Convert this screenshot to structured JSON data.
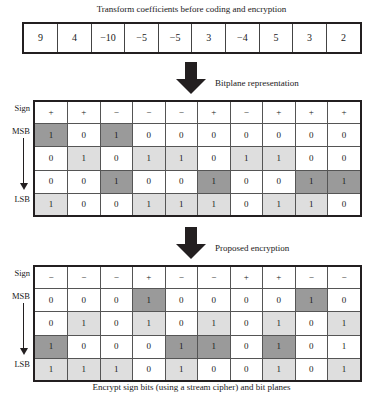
{
  "figure": {
    "top_caption": "Transform coefficients before coding and encryption",
    "bottom_caption": "Encrypt sign bits (using a stream cipher) and bit planes",
    "stage_bitplane_label": "Bitplane representation",
    "stage_encrypt_label": "Proposed encryption",
    "sign_label": "Sign",
    "msb_label": "MSB",
    "lsb_label": "LSB"
  },
  "colors": {
    "ink": "#231f20",
    "shade_light": "#dedede",
    "shade_dark": "#9a9a9a",
    "cell_background": "#ffffff"
  },
  "coefficients": {
    "values": [
      "9",
      "4",
      "−10",
      "−5",
      "−5",
      "3",
      "−4",
      "5",
      "3",
      "2"
    ]
  },
  "bitplane_table": {
    "sign_row": {
      "values": [
        "+",
        "+",
        "−",
        "−",
        "−",
        "+",
        "−",
        "+",
        "+",
        "+"
      ],
      "shades": [
        "none",
        "none",
        "none",
        "none",
        "none",
        "none",
        "none",
        "none",
        "none",
        "none"
      ]
    },
    "rows": [
      {
        "label": "MSB",
        "values": [
          "1",
          "0",
          "1",
          "0",
          "0",
          "0",
          "0",
          "0",
          "0",
          "0"
        ],
        "shades": [
          "dark",
          "none",
          "dark",
          "none",
          "none",
          "none",
          "none",
          "none",
          "none",
          "none"
        ]
      },
      {
        "label": "",
        "values": [
          "0",
          "1",
          "0",
          "1",
          "1",
          "0",
          "1",
          "1",
          "0",
          "0"
        ],
        "shades": [
          "none",
          "light",
          "none",
          "light",
          "light",
          "none",
          "light",
          "light",
          "none",
          "none"
        ]
      },
      {
        "label": "",
        "values": [
          "0",
          "0",
          "1",
          "0",
          "0",
          "1",
          "0",
          "0",
          "1",
          "1"
        ],
        "shades": [
          "none",
          "none",
          "dark",
          "none",
          "none",
          "dark",
          "none",
          "none",
          "dark",
          "dark"
        ]
      },
      {
        "label": "LSB",
        "values": [
          "1",
          "0",
          "0",
          "1",
          "1",
          "1",
          "0",
          "1",
          "1",
          "0"
        ],
        "shades": [
          "light",
          "none",
          "none",
          "light",
          "light",
          "light",
          "none",
          "light",
          "light",
          "none"
        ]
      }
    ]
  },
  "encrypted_table": {
    "sign_row": {
      "values": [
        "−",
        "−",
        "−",
        "+",
        "−",
        "−",
        "+",
        "+",
        "−",
        "−"
      ],
      "shades": [
        "none",
        "none",
        "none",
        "none",
        "none",
        "none",
        "none",
        "none",
        "none",
        "none"
      ]
    },
    "rows": [
      {
        "label": "MSB",
        "values": [
          "0",
          "0",
          "0",
          "1",
          "0",
          "0",
          "0",
          "0",
          "1",
          "0"
        ],
        "shades": [
          "none",
          "none",
          "none",
          "dark",
          "none",
          "none",
          "none",
          "none",
          "dark",
          "none"
        ]
      },
      {
        "label": "",
        "values": [
          "0",
          "1",
          "0",
          "1",
          "0",
          "1",
          "0",
          "1",
          "0",
          "1"
        ],
        "shades": [
          "none",
          "light",
          "none",
          "light",
          "none",
          "light",
          "none",
          "light",
          "none",
          "light"
        ]
      },
      {
        "label": "",
        "values": [
          "1",
          "0",
          "0",
          "0",
          "1",
          "1",
          "0",
          "1",
          "0",
          "1"
        ],
        "shades": [
          "dark",
          "none",
          "none",
          "none",
          "dark",
          "dark",
          "none",
          "dark",
          "none",
          "none"
        ]
      },
      {
        "label": "LSB",
        "values": [
          "1",
          "1",
          "1",
          "0",
          "1",
          "0",
          "0",
          "1",
          "0",
          "1"
        ],
        "shades": [
          "light",
          "light",
          "light",
          "none",
          "light",
          "none",
          "none",
          "light",
          "none",
          "light"
        ]
      }
    ]
  }
}
